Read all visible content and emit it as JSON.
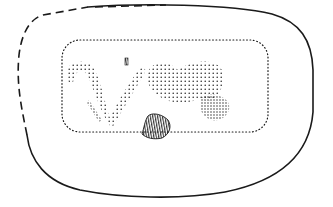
{
  "figure": {
    "description": "Line drawing of an object outline with a stippled rectangular border enclosing a stippled motif",
    "colors": {
      "ink": "#1a1a1a",
      "background": "#ffffff"
    },
    "elements": {
      "outer_outline_solid": "solid outer contour",
      "outer_outline_dashed": "dashed (reconstructed) outer contour, top-left",
      "inner_frame": "stippled rounded rectangle frame",
      "motif_v": "stippled V-shaped band",
      "motif_mass": "stippled rounded mass on right",
      "dense_patch": "densely stippled patch",
      "hatched_element": "hatched bell-shaped element",
      "small_mark": "small hatched mark"
    }
  }
}
